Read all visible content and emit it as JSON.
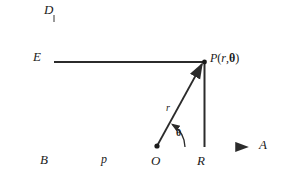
{
  "figure": {
    "background_color": "#ffffff",
    "line_color": "#2b2b2b",
    "axis_color": "#7d7d7d",
    "width": 282,
    "height": 187
  },
  "labels": {
    "axis_top": "D",
    "axis_right": "A",
    "point_E": "E",
    "point_B": "B",
    "point_O": "O",
    "point_R": "R",
    "segment_p": "p",
    "segment_r": "r",
    "angle_theta": "θ",
    "point_P": {
      "name": "P",
      "open_paren": "(",
      "arg_r": "r",
      "comma": ",",
      "arg_theta": "θ",
      "close_paren": ")",
      "full": "P(r, θ)"
    }
  },
  "geometry": {
    "vertical_axis": {
      "x": 54,
      "y_top": 13,
      "y_bottom": 178
    },
    "horizontal_axis": {
      "y": 147,
      "x_left": 15,
      "x_right": 250
    },
    "directrix_line": {
      "y": 62,
      "x_start": 54,
      "x_end": 205
    },
    "point_P": {
      "x": 204,
      "y": 62
    },
    "point_R": {
      "x": 204,
      "y": 147
    },
    "point_O": {
      "x": 157,
      "y": 146
    },
    "point_E": {
      "x": 54,
      "y": 62
    },
    "point_B": {
      "x": 54,
      "y": 147
    },
    "radius_line": {
      "x1": 157,
      "y1": 146,
      "x2": 204,
      "y2": 62
    },
    "angle_arc_radius": 26
  }
}
